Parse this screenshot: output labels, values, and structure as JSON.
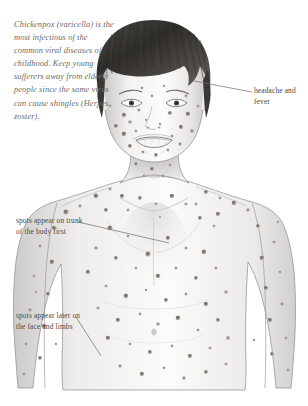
{
  "page": {
    "background_color": "#ffffff",
    "width": 308,
    "height": 406
  },
  "intro": {
    "text": "Chickenpox (varicella) is the most infectious of the common viral diseases of childhood. Keep young sufferers away from elderly people since the same virus can cause shingles (Herpes zoster).",
    "color": "#6c6a68",
    "style": "italic"
  },
  "callouts": {
    "headache": {
      "text": "headache and fever",
      "side": "right",
      "color": "#4a4846"
    },
    "trunk": {
      "text": "spots appear on trunk of the body first",
      "side": "left",
      "color": "#4a4846"
    },
    "limbs": {
      "text": "spots appear later on the face and limbs",
      "side": "left",
      "color": "#4a4846"
    }
  },
  "illustration": {
    "name": "child-torso-and-head-pencil-drawing",
    "hair_color": "#3c3a39",
    "skin_outline_color": "#8d8b89",
    "skin_shade_color": "#e8e7e6",
    "spot_color": "#7a736e",
    "spot_ring_color": "#a9a29c",
    "spot_count": 132,
    "leader_line_color": "#6e6c6a"
  }
}
